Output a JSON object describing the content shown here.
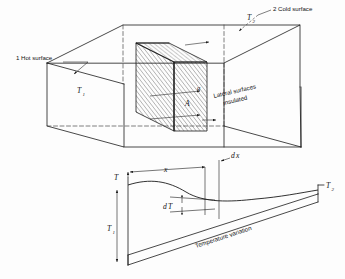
{
  "figure": {
    "background_color": "#fdfdfd",
    "line_color": "#1b1b1b"
  },
  "upper_diagram": {
    "name": "three-dimensional slab perspective",
    "labels": {
      "hot_surface": "1 Hot surface",
      "cold_surface": "2 Cold surface",
      "lateral_line1": "Lateral surfaces",
      "lateral_line2": "insulated",
      "temp_hot": "T",
      "temp_hot_sub": "1",
      "temp_cold": "T",
      "temp_cold_sub": "2",
      "area": "A",
      "heat_flux": "q"
    }
  },
  "lower_diagram": {
    "name": "temperature variation plot",
    "labels": {
      "axis_temperature": "T",
      "distance_x": "x",
      "element_dx": "d",
      "element_dx_var": "x",
      "delta_temperature": "d",
      "delta_temperature_var": "T",
      "caption": "Temperature variation",
      "temp_left": "T",
      "temp_left_sub": "1",
      "temp_right": "T",
      "temp_right_sub": "2"
    }
  }
}
